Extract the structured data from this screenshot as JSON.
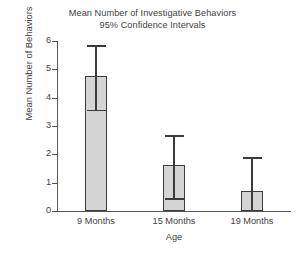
{
  "chart_data": {
    "type": "bar",
    "title": "Mean Number of Investigative Behaviors",
    "subtitle": "95% Confidence Intervals",
    "xlabel": "Age",
    "ylabel": "Mean Number of Behaviors",
    "categories": [
      "9 Months",
      "15 Months",
      "19 Months"
    ],
    "values": [
      4.75,
      1.62,
      0.7
    ],
    "error_low": [
      3.57,
      0.46,
      0.0
    ],
    "error_high": [
      5.85,
      2.68,
      1.9
    ],
    "ylim": [
      0,
      6
    ],
    "yticks": [
      0,
      1,
      2,
      3,
      4,
      5,
      6
    ],
    "ytick_labels": [
      "0",
      "1",
      "2",
      "3",
      "4",
      "5",
      "6"
    ],
    "grid": false,
    "legend": false,
    "bar_fill_color": "#d4d4d4",
    "bar_edge_color": "#3b3b3b",
    "axis_color": "#555555",
    "text_color": "#3f3f3f",
    "background_color": "#ffffff",
    "error_bar_kind": "95% Confidence Intervals",
    "series": [
      {
        "name": "Mean Number of Behaviors",
        "points": [
          {
            "category": "9 Months",
            "value": 4.75,
            "ci_low": 3.57,
            "ci_high": 5.85
          },
          {
            "category": "15 Months",
            "value": 1.62,
            "ci_low": 0.46,
            "ci_high": 2.68
          },
          {
            "category": "19 Months",
            "value": 0.7,
            "ci_low": 0.0,
            "ci_high": 1.9
          }
        ]
      }
    ]
  }
}
